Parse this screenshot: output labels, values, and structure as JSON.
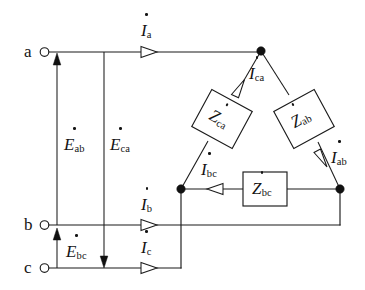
{
  "figure": {
    "type": "delta-connected three-phase circuit diagram",
    "background_color": "#ffffff",
    "line_color": "#1b1b1b"
  },
  "terminals": [
    {
      "name": "a",
      "label": "a",
      "x": 42,
      "y": 52
    },
    {
      "name": "b",
      "label": "b",
      "x": 42,
      "y": 225
    },
    {
      "name": "c",
      "label": "c",
      "x": 42,
      "y": 268
    }
  ],
  "source_voltages": [
    {
      "name": "E_ab",
      "symbol": "E",
      "subscript": "ab",
      "direction": "up"
    },
    {
      "name": "E_ca",
      "symbol": "E",
      "subscript": "ca",
      "direction": "down"
    },
    {
      "name": "E_bc",
      "symbol": "E",
      "subscript": "bc",
      "direction": "up"
    }
  ],
  "line_currents": [
    {
      "name": "I_a",
      "symbol": "I",
      "subscript": "a",
      "direction": "right"
    },
    {
      "name": "I_b",
      "symbol": "I",
      "subscript": "b",
      "direction": "right"
    },
    {
      "name": "I_c",
      "symbol": "I",
      "subscript": "c",
      "direction": "right"
    }
  ],
  "phase_currents": [
    {
      "name": "I_ca",
      "symbol": "I",
      "subscript": "ca",
      "direction": "up-right"
    },
    {
      "name": "I_ab",
      "symbol": "I",
      "subscript": "ab",
      "direction": "down-right"
    },
    {
      "name": "I_bc",
      "symbol": "I",
      "subscript": "bc",
      "direction": "left"
    }
  ],
  "impedances": [
    {
      "name": "Z_ca",
      "symbol": "Z",
      "subscript": "ca",
      "rotation_deg": 28
    },
    {
      "name": "Z_ab",
      "symbol": "Z",
      "subscript": "ab",
      "rotation_deg": -28
    },
    {
      "name": "Z_bc",
      "symbol": "Z",
      "subscript": "bc",
      "rotation_deg": 0
    }
  ],
  "nodes": [
    {
      "name": "node-top",
      "x": 261,
      "y": 51
    },
    {
      "name": "node-bottom-left",
      "x": 181,
      "y": 189
    },
    {
      "name": "node-bottom-right",
      "x": 340,
      "y": 189
    }
  ]
}
